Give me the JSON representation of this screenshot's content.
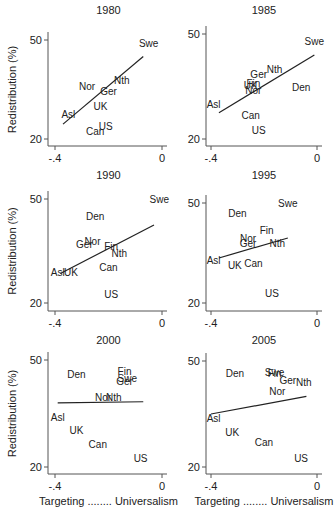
{
  "figure": {
    "ylabel": "Redistribution (%)",
    "xlabel": "Targeting ........ Universalism"
  },
  "chart_data": [
    {
      "type": "scatter",
      "title": "1980",
      "xlim": [
        -0.4,
        0
      ],
      "ylim": [
        20,
        50
      ],
      "xticks": [
        "-.4",
        "0"
      ],
      "yticks": [
        "20",
        "50"
      ],
      "points": [
        {
          "label": "Swe",
          "x": -0.05,
          "y": 49
        },
        {
          "label": "Nth",
          "x": -0.15,
          "y": 38
        },
        {
          "label": "Nor",
          "x": -0.28,
          "y": 36
        },
        {
          "label": "Ger",
          "x": -0.2,
          "y": 34.5
        },
        {
          "label": "UK",
          "x": -0.23,
          "y": 30
        },
        {
          "label": "Asl",
          "x": -0.35,
          "y": 27.5
        },
        {
          "label": "US",
          "x": -0.21,
          "y": 24
        },
        {
          "label": "Can",
          "x": -0.25,
          "y": 22.5
        }
      ],
      "fit_line": {
        "x1": -0.37,
        "y1": 24.5,
        "x2": -0.07,
        "y2": 45
      }
    },
    {
      "type": "scatter",
      "title": "1985",
      "xlim": [
        -0.4,
        0
      ],
      "ylim": [
        20,
        50
      ],
      "xticks": [
        "-.4",
        "0"
      ],
      "yticks": [
        "20",
        "50"
      ],
      "points": [
        {
          "label": "Swe",
          "x": -0.01,
          "y": 48
        },
        {
          "label": "Nth",
          "x": -0.16,
          "y": 40
        },
        {
          "label": "Ger",
          "x": -0.22,
          "y": 38.5
        },
        {
          "label": "Fin",
          "x": -0.24,
          "y": 36
        },
        {
          "label": "UK",
          "x": -0.25,
          "y": 35.5
        },
        {
          "label": "Den",
          "x": -0.06,
          "y": 35
        },
        {
          "label": "Nor",
          "x": -0.24,
          "y": 34
        },
        {
          "label": "Asl",
          "x": -0.39,
          "y": 30
        },
        {
          "label": "Can",
          "x": -0.25,
          "y": 27
        },
        {
          "label": "US",
          "x": -0.22,
          "y": 22.5
        }
      ],
      "fit_line": {
        "x1": -0.37,
        "y1": 27.5,
        "x2": -0.01,
        "y2": 44
      }
    },
    {
      "type": "scatter",
      "title": "1990",
      "xlim": [
        -0.4,
        0
      ],
      "ylim": [
        20,
        50
      ],
      "xticks": [
        "-.4",
        "0"
      ],
      "yticks": [
        "20",
        "50"
      ],
      "points": [
        {
          "label": "Swe",
          "x": -0.01,
          "y": 50
        },
        {
          "label": "Den",
          "x": -0.25,
          "y": 45
        },
        {
          "label": "Nor",
          "x": -0.26,
          "y": 38
        },
        {
          "label": "Ger",
          "x": -0.29,
          "y": 37
        },
        {
          "label": "Fin",
          "x": -0.19,
          "y": 36.5
        },
        {
          "label": "Nth",
          "x": -0.16,
          "y": 34.5
        },
        {
          "label": "Can",
          "x": -0.2,
          "y": 30.5
        },
        {
          "label": "Asl",
          "x": -0.39,
          "y": 29
        },
        {
          "label": "UK",
          "x": -0.34,
          "y": 29
        },
        {
          "label": "US",
          "x": -0.19,
          "y": 22.5
        }
      ],
      "fit_line": {
        "x1": -0.38,
        "y1": 28.5,
        "x2": -0.03,
        "y2": 42.5
      }
    },
    {
      "type": "scatter",
      "title": "1995",
      "xlim": [
        -0.4,
        0
      ],
      "ylim": [
        20,
        50
      ],
      "xticks": [
        "-.4",
        "0"
      ],
      "yticks": [
        "20",
        "50"
      ],
      "points": [
        {
          "label": "Swe",
          "x": -0.11,
          "y": 50
        },
        {
          "label": "Den",
          "x": -0.3,
          "y": 47
        },
        {
          "label": "Fin",
          "x": -0.19,
          "y": 42
        },
        {
          "label": "Nor",
          "x": -0.26,
          "y": 39.5
        },
        {
          "label": "Ger",
          "x": -0.26,
          "y": 38
        },
        {
          "label": "Nth",
          "x": -0.15,
          "y": 38
        },
        {
          "label": "Asl",
          "x": -0.39,
          "y": 33
        },
        {
          "label": "UK",
          "x": -0.31,
          "y": 31.5
        },
        {
          "label": "Can",
          "x": -0.24,
          "y": 32
        },
        {
          "label": "US",
          "x": -0.17,
          "y": 23
        }
      ],
      "fit_line": {
        "x1": -0.37,
        "y1": 33.5,
        "x2": -0.11,
        "y2": 39.5
      }
    },
    {
      "type": "scatter",
      "title": "2000",
      "xlim": [
        -0.4,
        0
      ],
      "ylim": [
        20,
        50
      ],
      "xticks": [
        "-.4",
        "0"
      ],
      "yticks": [
        "20",
        "50"
      ],
      "points": [
        {
          "label": "Fin",
          "x": -0.14,
          "y": 47
        },
        {
          "label": "Den",
          "x": -0.32,
          "y": 46
        },
        {
          "label": "Swe",
          "x": -0.13,
          "y": 45
        },
        {
          "label": "Ger",
          "x": -0.14,
          "y": 44
        },
        {
          "label": "Nor",
          "x": -0.22,
          "y": 39.5
        },
        {
          "label": "Nth",
          "x": -0.18,
          "y": 39.5
        },
        {
          "label": "Asl",
          "x": -0.39,
          "y": 34
        },
        {
          "label": "UK",
          "x": -0.32,
          "y": 30.5
        },
        {
          "label": "Can",
          "x": -0.24,
          "y": 26.5
        },
        {
          "label": "US",
          "x": -0.08,
          "y": 22.5
        }
      ],
      "fit_line": {
        "x1": -0.39,
        "y1": 38,
        "x2": -0.07,
        "y2": 38.3
      }
    },
    {
      "type": "scatter",
      "title": "2005",
      "xlim": [
        -0.4,
        0
      ],
      "ylim": [
        20,
        50
      ],
      "xticks": [
        "-.4",
        "0"
      ],
      "yticks": [
        "20",
        "50"
      ],
      "points": [
        {
          "label": "Swe",
          "x": -0.16,
          "y": 47
        },
        {
          "label": "Fin",
          "x": -0.16,
          "y": 46.5
        },
        {
          "label": "Den",
          "x": -0.31,
          "y": 46.5
        },
        {
          "label": "Ger",
          "x": -0.11,
          "y": 44.5
        },
        {
          "label": "Nth",
          "x": -0.05,
          "y": 44
        },
        {
          "label": "Nor",
          "x": -0.15,
          "y": 41.5
        },
        {
          "label": "Asl",
          "x": -0.39,
          "y": 34
        },
        {
          "label": "UK",
          "x": -0.32,
          "y": 30
        },
        {
          "label": "Can",
          "x": -0.2,
          "y": 27
        },
        {
          "label": "US",
          "x": -0.06,
          "y": 22.5
        }
      ],
      "fit_line": {
        "x1": -0.4,
        "y1": 35,
        "x2": -0.04,
        "y2": 40
      }
    }
  ]
}
